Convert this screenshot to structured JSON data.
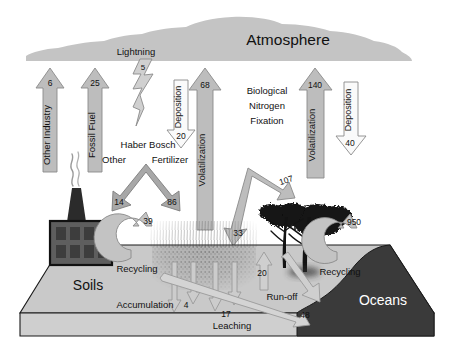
{
  "diagram": {
    "reservoirs": {
      "atmosphere": "Atmosphere",
      "soils": "Soils",
      "oceans": "Oceans"
    },
    "colors": {
      "fill_gray": "#bdbdbd",
      "arrow_gray": "#b4b4b4",
      "arrow_outline": "#808080",
      "soil_top": "#c9c9c9",
      "soil_front": "#c2c2c2",
      "ocean": "#3a3a3a",
      "cloud": "#c4c4c4",
      "factory": "#5c5c5c",
      "tree": "#141414",
      "text": "#111111",
      "ocean_text": "#ffffff"
    },
    "flux_unit": "Tg N per year"
  },
  "fluxes": {
    "other_industry": {
      "label": "Other Industry",
      "value": "6",
      "direction": "up"
    },
    "fossil_fuel": {
      "label": "Fossil Fuel",
      "value": "25",
      "direction": "up"
    },
    "lightning": {
      "label": "Lightning",
      "value": "5",
      "direction": "down"
    },
    "deposition_land": {
      "label": "Deposition",
      "value": "20",
      "direction": "down"
    },
    "volatilization_land": {
      "label": "Volatilization",
      "value": "68",
      "direction": "up"
    },
    "biological_nitrogen_fixation": {
      "label": "Biological\nNitrogen\nFixation",
      "line1": "Biological",
      "line2": "Nitrogen",
      "line3": "Fixation",
      "value_natural": "107",
      "value_agricultural": "33"
    },
    "volatilization_ocean": {
      "label": "Volatilization",
      "value": "140",
      "direction": "up"
    },
    "deposition_ocean": {
      "label": "Deposition",
      "value": "40",
      "direction": "down"
    },
    "haber_bosch": {
      "label": "Haber Bosch",
      "left_label": "Other",
      "left_value": "14",
      "right_label": "Fertilizer",
      "right_value": "86"
    },
    "recycling_soil": {
      "label": "Recycling",
      "value": "39"
    },
    "recycling_ocean": {
      "label": "Recycling",
      "value": "950"
    },
    "accumulation": {
      "label": "Accumulation",
      "value": "4"
    },
    "accumulation_secondary": {
      "value": "17"
    },
    "leaching": {
      "label": "Leaching",
      "value": "20"
    },
    "runoff": {
      "label": "Run-off",
      "value": "48"
    }
  }
}
